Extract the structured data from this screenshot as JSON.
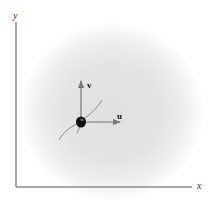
{
  "diagram": {
    "axes": {
      "x_label": "x",
      "y_label": "y"
    },
    "vectors": [
      {
        "name": "u",
        "label": "u",
        "direction": "right"
      },
      {
        "name": "v",
        "label": "v",
        "direction": "up"
      }
    ],
    "particle": {
      "shape": "dot",
      "color": "#111111"
    },
    "path": {
      "shape": "curve",
      "color": "#888888"
    },
    "colors": {
      "axis": "#555555",
      "vector": "#777777",
      "glow": "#e0e0e0"
    }
  }
}
